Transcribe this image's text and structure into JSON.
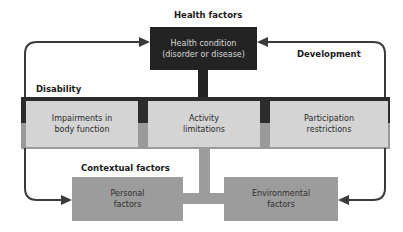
{
  "labels": {
    "health_factors": "Health factors",
    "development": "Development",
    "disability": "Disability",
    "contextual_factors": "Contextual factors"
  },
  "boxes": {
    "health_condition": {
      "line1": "Health condition",
      "line2": "(disorder or disease)"
    },
    "impairments": {
      "line1": "Impairments in",
      "line2": "body function"
    },
    "activity": {
      "line1": "Activity",
      "line2": "limitations"
    },
    "participation": {
      "line1": "Participation",
      "line2": "restrictions"
    },
    "personal": {
      "line1": "Personal",
      "line2": "factors"
    },
    "environmental": {
      "line1": "Environmental",
      "line2": "factors"
    }
  },
  "colors": {
    "health_box": "#232323",
    "disability_box": "#d4d4d4",
    "contextual_box": "#9c9c9c",
    "arrow": "#3a3a3a"
  }
}
